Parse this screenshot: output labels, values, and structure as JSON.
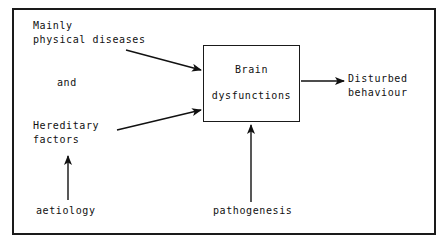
{
  "diagram": {
    "frame_color": "#1a1a1a",
    "text_color": "#111111",
    "background": "#ffffff",
    "nodes": {
      "physical": {
        "line1": "Mainly",
        "line2": "physical diseases"
      },
      "conjunction": {
        "text": "and"
      },
      "hereditary": {
        "line1": "Hereditary",
        "line2": "factors"
      },
      "central_box": {
        "line1": "Brain",
        "line2": "dysfunctions"
      },
      "outcome": {
        "line1": "Disturbed",
        "line2": "behaviour"
      },
      "aetiology": {
        "text": "aetiology"
      },
      "pathogenesis": {
        "text": "pathogenesis"
      }
    },
    "arrows": [
      {
        "name": "physical-to-brain",
        "from": "Mainly physical diseases",
        "to": "Brain dysfunctions"
      },
      {
        "name": "hereditary-to-brain",
        "from": "Hereditary factors",
        "to": "Brain dysfunctions"
      },
      {
        "name": "brain-to-outcome",
        "from": "Brain dysfunctions",
        "to": "Disturbed behaviour"
      },
      {
        "name": "aetiology-to-hereditary",
        "from": "aetiology",
        "to": "Hereditary factors"
      },
      {
        "name": "pathogenesis-to-brain",
        "from": "pathogenesis",
        "to": "Brain dysfunctions"
      }
    ]
  }
}
